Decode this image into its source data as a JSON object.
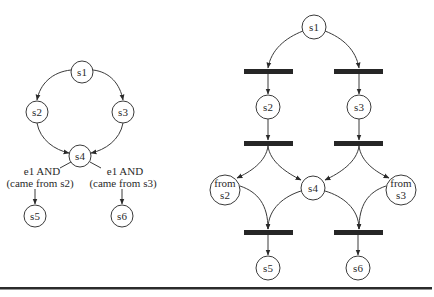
{
  "left_diagram": {
    "type": "state-machine",
    "nodes": [
      {
        "id": "s1",
        "label": "s1",
        "x": 82,
        "y": 72,
        "r": 11
      },
      {
        "id": "s2",
        "label": "s2",
        "x": 37,
        "y": 112,
        "r": 11
      },
      {
        "id": "s3",
        "label": "s3",
        "x": 123,
        "y": 112,
        "r": 11
      },
      {
        "id": "s4",
        "label": "s4",
        "x": 80,
        "y": 156,
        "r": 11
      },
      {
        "id": "s5",
        "label": "s5",
        "x": 35,
        "y": 216,
        "r": 11
      },
      {
        "id": "s6",
        "label": "s6",
        "x": 122,
        "y": 216,
        "r": 11
      }
    ],
    "edges": [
      {
        "from": "s1",
        "to": "s2"
      },
      {
        "from": "s1",
        "to": "s3"
      },
      {
        "from": "s2",
        "to": "s4"
      },
      {
        "from": "s3",
        "to": "s4"
      },
      {
        "from": "s4",
        "to": "s5",
        "label_line1": "e1 AND",
        "label_line2": "(came from s2)"
      },
      {
        "from": "s4",
        "to": "s6",
        "label_line1": "e1 AND",
        "label_line2": "(came from s3)"
      }
    ],
    "labels": {
      "left_line1": "e1 AND",
      "left_line2": "(came from s2)",
      "right_line1": "e1 AND",
      "right_line2": "(came from s3)"
    }
  },
  "right_diagram": {
    "type": "petri-net",
    "places": [
      {
        "id": "s1",
        "label": "s1",
        "x": 314,
        "y": 27,
        "r": 12
      },
      {
        "id": "s2",
        "label": "s2",
        "x": 268,
        "y": 107,
        "r": 12
      },
      {
        "id": "s3",
        "label": "s3",
        "x": 359,
        "y": 107,
        "r": 12
      },
      {
        "id": "from_s2",
        "label_line1": "from",
        "label_line2": "s2",
        "x": 225,
        "y": 190,
        "r": 15
      },
      {
        "id": "s4",
        "label": "s4",
        "x": 313,
        "y": 188,
        "r": 12
      },
      {
        "id": "from_s3",
        "label_line1": "from",
        "label_line2": "s3",
        "x": 401,
        "y": 190,
        "r": 15
      },
      {
        "id": "s5",
        "label": "s5",
        "x": 268,
        "y": 268,
        "r": 12
      },
      {
        "id": "s6",
        "label": "s6",
        "x": 358,
        "y": 268,
        "r": 12
      }
    ],
    "transitions": [
      {
        "id": "t1",
        "x": 268,
        "y": 71
      },
      {
        "id": "t2",
        "x": 359,
        "y": 71
      },
      {
        "id": "t3",
        "x": 268,
        "y": 143
      },
      {
        "id": "t4",
        "x": 359,
        "y": 143
      },
      {
        "id": "t5",
        "x": 268,
        "y": 232
      },
      {
        "id": "t6",
        "x": 359,
        "y": 232
      }
    ],
    "arcs": [
      {
        "from": "s1",
        "to": "t1"
      },
      {
        "from": "s1",
        "to": "t2"
      },
      {
        "from": "t1",
        "to": "s2"
      },
      {
        "from": "t2",
        "to": "s3"
      },
      {
        "from": "s2",
        "to": "t3"
      },
      {
        "from": "s3",
        "to": "t4"
      },
      {
        "from": "t3",
        "to": "from_s2"
      },
      {
        "from": "t3",
        "to": "s4"
      },
      {
        "from": "t4",
        "to": "s4"
      },
      {
        "from": "t4",
        "to": "from_s3"
      },
      {
        "from": "from_s2",
        "to": "t5"
      },
      {
        "from": "s4",
        "to": "t5"
      },
      {
        "from": "s4",
        "to": "t6"
      },
      {
        "from": "from_s3",
        "to": "t6"
      },
      {
        "from": "t5",
        "to": "s5"
      },
      {
        "from": "t6",
        "to": "s6"
      }
    ]
  },
  "colors": {
    "stroke": "#3a3a3a",
    "bar": "#262626",
    "background": "#ffffff"
  }
}
